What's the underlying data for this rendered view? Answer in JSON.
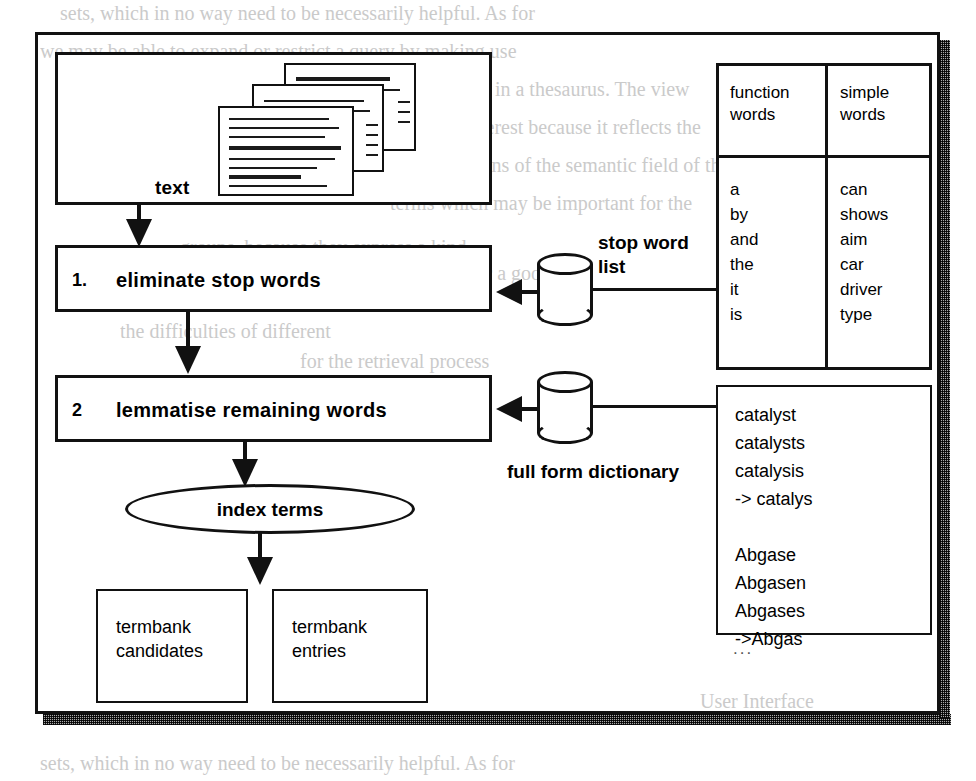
{
  "figure": {
    "type": "flowchart",
    "title_text_box": "text",
    "steps": [
      {
        "number": "1.",
        "label": "eliminate  stop words"
      },
      {
        "number": "2",
        "label": "lemmatise remaining words"
      }
    ],
    "output_node": "index terms",
    "outputs": [
      {
        "line1": "termbank",
        "line2": "candidates"
      },
      {
        "line1": "termbank",
        "line2": "entries"
      }
    ],
    "datastores": [
      {
        "name": "stop-word-list",
        "line1": "stop word",
        "line2": "list"
      },
      {
        "name": "full-form-dictionary",
        "line1": "full form dictionary",
        "line2": ""
      }
    ]
  },
  "word_table": {
    "headers": [
      {
        "line1": "function",
        "line2": "words"
      },
      {
        "line1": "simple",
        "line2": "words"
      }
    ],
    "columns": [
      [
        "a",
        "by",
        "and",
        "the",
        "it",
        "is"
      ],
      [
        "can",
        "shows",
        "aim",
        "car",
        "driver",
        "type"
      ]
    ]
  },
  "dictionary_box": {
    "entries": "catalyst\ncatalysts\ncatalysis\n-> catalys\n\nAbgase\nAbgasen\nAbgases\n->Abgas",
    "ellipsis": "..."
  },
  "bleed_text": {
    "lines": [
      "sets, which in no way need to be necessarily helpful. As for",
      "we may be able to expand or restrict a query by making use",
      "... the relations encoded in a thesaurus. The view",
      "a thesaurus is of interest because it reflects the",
      "structural relations of the semantic field of the",
      "terms which may be important for the",
      "groups, because they express a kind",
      "of them. If help the user a good",
      "the user on the one hand and",
      "the difficulties of different",
      "for the retrieval process",
      "words",
      "User Interface"
    ]
  }
}
